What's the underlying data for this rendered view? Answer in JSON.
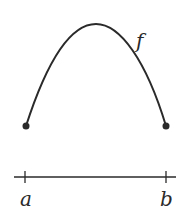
{
  "diagram": {
    "function_label": "f",
    "left_endpoint_label": "a",
    "right_endpoint_label": "b",
    "curve": {
      "shape": "concave-down arc",
      "left_point": [
        26,
        126
      ],
      "peak": [
        95,
        24
      ],
      "right_point": [
        166,
        126
      ]
    },
    "axis": {
      "y": 177,
      "x_start": 14,
      "x_end": 176,
      "ticks_x": [
        25,
        166
      ]
    },
    "colors": {
      "stroke": "#2a2a2a",
      "background": "#ffffff"
    }
  }
}
